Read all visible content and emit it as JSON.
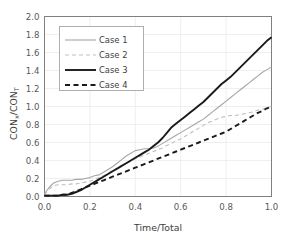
{
  "chart_data": {
    "type": "line",
    "title": "",
    "xlabel": "Time/Total",
    "ylabel": "CONx/CONT",
    "ylabel_parts": {
      "base1": "CON",
      "sub1": "x",
      "slash": "/",
      "base2": "CON",
      "sub2": "T"
    },
    "xlim": [
      0.0,
      1.0
    ],
    "ylim": [
      0.0,
      2.0
    ],
    "xticks": [
      "0.0",
      "0.2",
      "0.4",
      "0.6",
      "0.8",
      "1.0"
    ],
    "xtick_values": [
      0.0,
      0.2,
      0.4,
      0.6,
      0.8,
      1.0
    ],
    "yticks": [
      "0.0",
      "0.2",
      "0.4",
      "0.6",
      "0.8",
      "1.0",
      "1.2",
      "1.4",
      "1.6",
      "1.8",
      "2.0"
    ],
    "ytick_values": [
      0.0,
      0.2,
      0.4,
      0.6,
      0.8,
      1.0,
      1.2,
      1.4,
      1.6,
      1.8,
      2.0
    ],
    "grid": true,
    "grid_color": "#e8e8e8",
    "legend_position": "upper-left-inside",
    "x": [
      0.0,
      0.02,
      0.04,
      0.06,
      0.08,
      0.1,
      0.12,
      0.14,
      0.16,
      0.18,
      0.2,
      0.22,
      0.24,
      0.26,
      0.28,
      0.3,
      0.32,
      0.34,
      0.36,
      0.38,
      0.4,
      0.42,
      0.44,
      0.46,
      0.48,
      0.5,
      0.52,
      0.54,
      0.56,
      0.58,
      0.6,
      0.62,
      0.64,
      0.66,
      0.68,
      0.7,
      0.72,
      0.74,
      0.76,
      0.78,
      0.8,
      0.82,
      0.84,
      0.86,
      0.88,
      0.9,
      0.92,
      0.94,
      0.96,
      0.98,
      1.0
    ],
    "series": [
      {
        "name": "Case 1",
        "color": "#a6a6a6",
        "width": 1.1,
        "dash": "none",
        "values": [
          0.03,
          0.1,
          0.15,
          0.17,
          0.18,
          0.18,
          0.18,
          0.19,
          0.19,
          0.2,
          0.21,
          0.23,
          0.24,
          0.27,
          0.3,
          0.33,
          0.37,
          0.41,
          0.45,
          0.48,
          0.51,
          0.52,
          0.53,
          0.53,
          0.54,
          0.56,
          0.59,
          0.62,
          0.65,
          0.68,
          0.71,
          0.74,
          0.77,
          0.8,
          0.83,
          0.86,
          0.9,
          0.94,
          0.98,
          1.02,
          1.06,
          1.1,
          1.14,
          1.18,
          1.22,
          1.26,
          1.3,
          1.34,
          1.38,
          1.41,
          1.44
        ]
      },
      {
        "name": "Case 2",
        "color": "#bfbfbf",
        "width": 1.1,
        "dash": "4,3",
        "values": [
          0.02,
          0.08,
          0.12,
          0.13,
          0.13,
          0.13,
          0.14,
          0.14,
          0.15,
          0.16,
          0.17,
          0.19,
          0.21,
          0.23,
          0.26,
          0.29,
          0.31,
          0.34,
          0.37,
          0.39,
          0.42,
          0.44,
          0.46,
          0.48,
          0.5,
          0.52,
          0.54,
          0.57,
          0.59,
          0.62,
          0.64,
          0.67,
          0.7,
          0.73,
          0.76,
          0.79,
          0.82,
          0.84,
          0.86,
          0.88,
          0.89,
          0.9,
          0.9,
          0.91,
          0.92,
          0.93,
          0.94,
          0.96,
          0.97,
          0.99,
          1.0
        ]
      },
      {
        "name": "Case 3",
        "color": "#1a1a1a",
        "width": 1.9,
        "dash": "none",
        "values": [
          0.01,
          0.01,
          0.01,
          0.01,
          0.02,
          0.02,
          0.03,
          0.05,
          0.07,
          0.1,
          0.13,
          0.16,
          0.19,
          0.22,
          0.25,
          0.28,
          0.31,
          0.34,
          0.37,
          0.4,
          0.43,
          0.46,
          0.49,
          0.52,
          0.56,
          0.6,
          0.65,
          0.71,
          0.77,
          0.81,
          0.85,
          0.89,
          0.93,
          0.97,
          1.01,
          1.05,
          1.1,
          1.15,
          1.2,
          1.25,
          1.29,
          1.33,
          1.38,
          1.43,
          1.48,
          1.53,
          1.58,
          1.63,
          1.68,
          1.73,
          1.77
        ]
      },
      {
        "name": "Case 4",
        "color": "#1a1a1a",
        "width": 1.9,
        "dash": "5,3.5",
        "values": [
          0.01,
          0.01,
          0.01,
          0.01,
          0.02,
          0.02,
          0.04,
          0.06,
          0.08,
          0.1,
          0.12,
          0.14,
          0.16,
          0.18,
          0.2,
          0.22,
          0.24,
          0.26,
          0.28,
          0.3,
          0.32,
          0.34,
          0.36,
          0.38,
          0.4,
          0.42,
          0.44,
          0.46,
          0.48,
          0.5,
          0.52,
          0.54,
          0.56,
          0.58,
          0.6,
          0.62,
          0.64,
          0.66,
          0.68,
          0.7,
          0.72,
          0.75,
          0.78,
          0.81,
          0.84,
          0.87,
          0.9,
          0.93,
          0.95,
          0.98,
          1.0
        ]
      }
    ]
  },
  "legend": {
    "items": [
      {
        "label": "Case 1"
      },
      {
        "label": "Case 2"
      },
      {
        "label": "Case 3"
      },
      {
        "label": "Case 4"
      }
    ]
  }
}
